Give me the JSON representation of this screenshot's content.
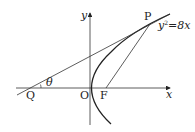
{
  "diagram": {
    "type": "geometry",
    "equation": "y²=8x",
    "equation_parts": {
      "y": "y",
      "exp": "2",
      "rest": "=8x"
    },
    "axes": {
      "x": "x",
      "y": "y"
    },
    "points": {
      "origin": "O",
      "focus": "F",
      "P": "P",
      "Q": "Q"
    },
    "angle": "θ"
  }
}
